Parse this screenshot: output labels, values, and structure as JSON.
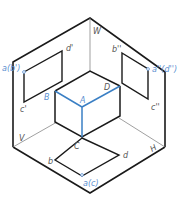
{
  "diagram": {
    "type": "three-plane projection (isometric view of V, H, W planes with cuboid)",
    "colors": {
      "outline": "#1a1a1a",
      "axis": "#777777",
      "highlight": "#3a7fc4",
      "label_dark": "#555555",
      "label_blue": "#5b8fd0"
    },
    "planes": {
      "w_label": "W",
      "v_label": "V",
      "h_label": "H"
    },
    "cuboid": {
      "labels": {
        "A": "A",
        "B": "B",
        "C": "C",
        "D": "D"
      }
    },
    "front_view": {
      "labels": {
        "ab": "a(b')",
        "d": "d'",
        "c": "c'"
      }
    },
    "side_view": {
      "labels": {
        "b": "b''",
        "ad": "a''(d'')",
        "c": "c''"
      }
    },
    "top_view": {
      "labels": {
        "b": "b",
        "d": "d",
        "ac": "a(c)"
      }
    }
  }
}
